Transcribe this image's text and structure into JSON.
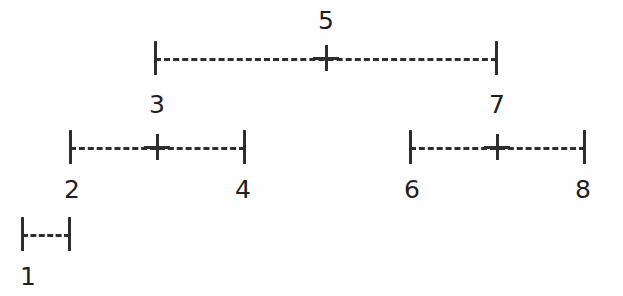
{
  "figure": {
    "width": 623,
    "height": 296,
    "background_color": "#fefefe",
    "stroke_color": "#2e2e2e",
    "text_color": "#1f1f1f",
    "dash_style": "dashed"
  },
  "levels": [
    {
      "name": "level-1",
      "interval": {
        "left_x": 155,
        "right_x": 497,
        "center_x": 326,
        "y": 58,
        "has_center_mark": true,
        "center_mark": "+",
        "left_cap": "|",
        "right_cap": "|"
      },
      "labels": {
        "center_above": "5",
        "left_below": "3",
        "right_below": "7"
      }
    },
    {
      "name": "level-2-left",
      "interval": {
        "left_x": 70,
        "right_x": 245,
        "center_x": 157,
        "y": 147,
        "has_center_mark": true,
        "center_mark": "+",
        "left_cap": "|",
        "right_cap": "|"
      },
      "labels": {
        "center_above": "3",
        "left_below": "2",
        "right_below": "4"
      }
    },
    {
      "name": "level-2-right",
      "interval": {
        "left_x": 410,
        "right_x": 585,
        "center_x": 497,
        "y": 147,
        "has_center_mark": true,
        "center_mark": "+",
        "left_cap": "|",
        "right_cap": "|"
      },
      "labels": {
        "center_above": "7",
        "left_below": "6",
        "right_below": "8"
      }
    },
    {
      "name": "level-3-left",
      "interval": {
        "left_x": 22,
        "right_x": 70,
        "center_x": 46,
        "y": 234,
        "has_center_mark": false,
        "center_mark": "",
        "left_cap": "|",
        "right_cap": "|"
      },
      "labels": {
        "center_above": "",
        "left_below": "1",
        "right_below": ""
      }
    }
  ],
  "nodes": {
    "n1": "1",
    "n2": "2",
    "n3": "3",
    "n4": "4",
    "n5": "5",
    "n6": "6",
    "n7": "7",
    "n8": "8"
  }
}
